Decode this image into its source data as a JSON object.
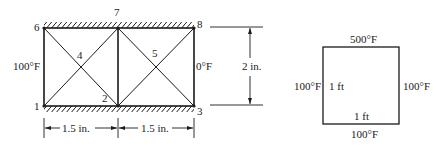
{
  "left_figure": {
    "node_labels": [
      "1",
      "2",
      "3",
      "4",
      "5",
      "6",
      "7",
      "8"
    ],
    "left_temp": "100°F",
    "right_temp": "0°F",
    "width_dim_1": "1.5 in.",
    "width_dim_2": "1.5 in.",
    "height_dim": "2 in."
  },
  "right_figure": {
    "top_temp": "500°F",
    "left_temp": "100°F",
    "right_temp": "100°F",
    "bottom_temp": "100°F",
    "side_length": "1 ft",
    "bottom_length": "1 ft"
  }
}
